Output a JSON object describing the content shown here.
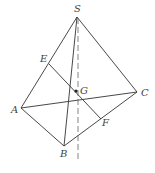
{
  "figure": {
    "type": "tetrahedron S-ABC",
    "points": {
      "S": {
        "label": "S",
        "x": 77,
        "y": 17,
        "lx": 74,
        "ly": 12
      },
      "A": {
        "label": "A",
        "x": 21,
        "y": 108,
        "lx": 11,
        "ly": 113
      },
      "B": {
        "label": "B",
        "x": 64,
        "y": 146,
        "lx": 60,
        "ly": 157
      },
      "C": {
        "label": "C",
        "x": 137,
        "y": 92,
        "lx": 141,
        "ly": 96
      },
      "E": {
        "label": "E",
        "x": 49,
        "y": 64,
        "lx": 40,
        "ly": 62
      },
      "F": {
        "label": "F",
        "x": 101,
        "y": 119,
        "lx": 102,
        "ly": 126
      },
      "G": {
        "label": "G",
        "x": 76,
        "y": 91,
        "lx": 80,
        "ly": 94
      }
    },
    "segments": [
      "SA",
      "SB",
      "SC",
      "AB",
      "BC",
      "AC",
      "EF"
    ],
    "dashed_line": {
      "x1": 78,
      "y1": 18,
      "x2": 78,
      "y2": 160
    }
  }
}
